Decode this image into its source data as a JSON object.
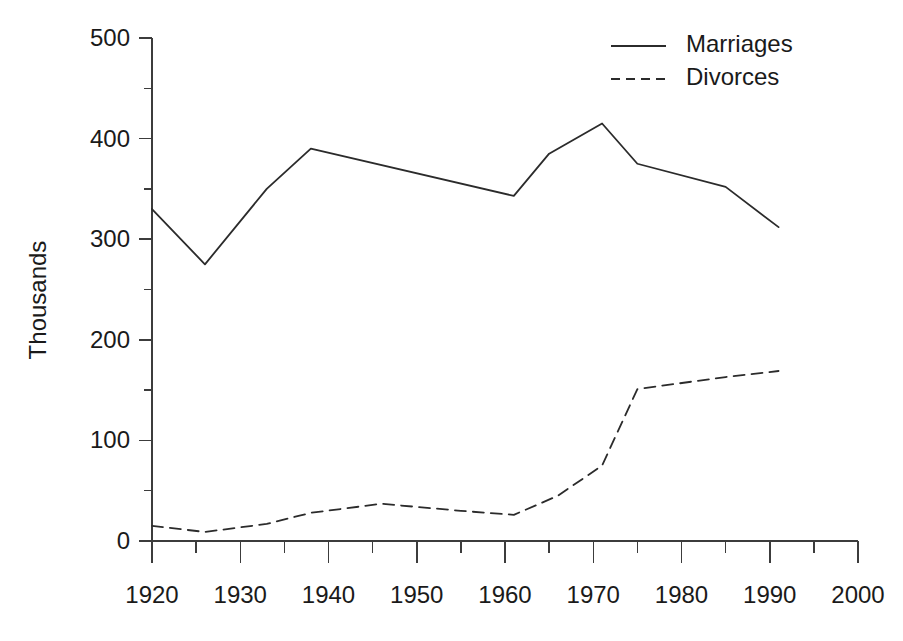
{
  "chart_data": {
    "type": "line",
    "title": "",
    "subtitle": "",
    "xlabel": "",
    "ylabel": "Thousands",
    "xlim": [
      1920,
      2000
    ],
    "ylim": [
      0,
      500
    ],
    "grid": false,
    "legend_position": "top-right",
    "x_ticks": [
      1920,
      1930,
      1940,
      1950,
      1960,
      1970,
      1980,
      1990,
      2000
    ],
    "x_tick_labels": [
      "1920",
      "1930",
      "1940",
      "1950",
      "1960",
      "1970",
      "1980",
      "1990",
      "2000"
    ],
    "x_minor_ticks": [
      1925,
      1935,
      1945,
      1955,
      1965,
      1975,
      1985,
      1995
    ],
    "y_ticks": [
      0,
      100,
      200,
      300,
      400,
      500
    ],
    "y_tick_labels": [
      "0",
      "100",
      "200",
      "300",
      "400",
      "500"
    ],
    "y_minor_ticks": [
      50,
      150,
      250,
      350,
      450
    ],
    "series": [
      {
        "name": "Marriages",
        "style": "solid",
        "color": "#2b2b2b",
        "x": [
          1920,
          1926,
          1933,
          1938,
          1961,
          1965,
          1971,
          1975,
          1985,
          1991
        ],
        "values": [
          330,
          275,
          350,
          390,
          343,
          385,
          415,
          375,
          352,
          312
        ]
      },
      {
        "name": "Divorces",
        "style": "dashed",
        "color": "#2b2b2b",
        "x": [
          1920,
          1926,
          1933,
          1938,
          1946,
          1955,
          1961,
          1966,
          1971,
          1975,
          1985,
          1991
        ],
        "values": [
          15,
          9,
          17,
          28,
          37,
          30,
          26,
          45,
          75,
          151,
          163,
          169
        ]
      }
    ]
  },
  "legend": {
    "entries": [
      {
        "label": "Marriages",
        "style": "solid"
      },
      {
        "label": "Divorces",
        "style": "dashed"
      }
    ]
  },
  "axes": {
    "y_title": "Thousands"
  }
}
